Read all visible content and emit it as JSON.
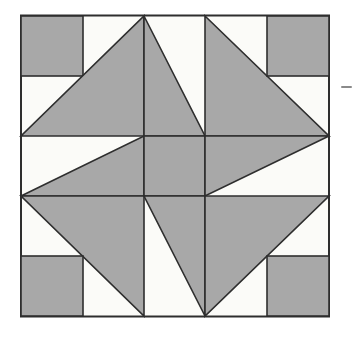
{
  "page": {
    "width": 352,
    "height": 337,
    "background": "#ffffff"
  },
  "quilt_block": {
    "description": "pinwheel-quilt-block-pattern",
    "frame": {
      "x": 21,
      "y": 15.5,
      "width": 308,
      "height": 301,
      "fill": "#fbfbf8",
      "stroke": "#2e2e2e",
      "stroke_width": 2
    },
    "colors": {
      "patch_gray": "#a8a8a8",
      "patch_white": "#fbfbf8",
      "outline": "#2e2e2e"
    },
    "patch_stroke_width": 1.6,
    "grid_xs": [
      21,
      83,
      144,
      205,
      267,
      329
    ],
    "grid_ys": [
      16,
      76,
      136,
      196,
      256,
      316
    ],
    "patches": [
      {
        "name": "corner-square-top-left",
        "type": "rect",
        "x": 21,
        "y": 16,
        "width": 62,
        "height": 60
      },
      {
        "name": "large-triangle-top-left",
        "type": "polygon",
        "points": [
          [
            144,
            16
          ],
          [
            144,
            136
          ],
          [
            21,
            136
          ]
        ]
      },
      {
        "name": "small-triangle-top-center",
        "type": "polygon",
        "points": [
          [
            144,
            16
          ],
          [
            205,
            136
          ],
          [
            144,
            136
          ]
        ]
      },
      {
        "name": "large-triangle-top-right",
        "type": "polygon",
        "points": [
          [
            205,
            16
          ],
          [
            329,
            136
          ],
          [
            205,
            136
          ]
        ]
      },
      {
        "name": "corner-square-top-right",
        "type": "rect",
        "x": 267,
        "y": 16,
        "width": 62,
        "height": 60
      },
      {
        "name": "triangle-middle-left",
        "type": "polygon",
        "points": [
          [
            144,
            136
          ],
          [
            144,
            196
          ],
          [
            21,
            196
          ]
        ]
      },
      {
        "name": "center-square",
        "type": "rect",
        "x": 144,
        "y": 136,
        "width": 61,
        "height": 60
      },
      {
        "name": "triangle-middle-right",
        "type": "polygon",
        "points": [
          [
            205,
            136
          ],
          [
            329,
            136
          ],
          [
            205,
            196
          ]
        ]
      },
      {
        "name": "large-triangle-bottom-left",
        "type": "polygon",
        "points": [
          [
            21,
            196
          ],
          [
            144,
            196
          ],
          [
            144,
            316
          ]
        ]
      },
      {
        "name": "corner-square-bottom-left",
        "type": "rect",
        "x": 21,
        "y": 256,
        "width": 62,
        "height": 60
      },
      {
        "name": "small-triangle-bottom-center",
        "type": "polygon",
        "points": [
          [
            144,
            196
          ],
          [
            205,
            196
          ],
          [
            205,
            316
          ]
        ]
      },
      {
        "name": "large-triangle-bottom-right",
        "type": "polygon",
        "points": [
          [
            205,
            196
          ],
          [
            329,
            196
          ],
          [
            205,
            316
          ]
        ]
      },
      {
        "name": "corner-square-bottom-right",
        "type": "rect",
        "x": 267,
        "y": 256,
        "width": 62,
        "height": 60
      }
    ]
  },
  "margin_dash": {
    "x": 341,
    "y": 86,
    "width": 11,
    "height": 2,
    "color": "#8a8a8a"
  }
}
